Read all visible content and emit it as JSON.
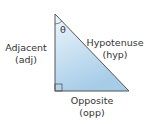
{
  "diagram": {
    "angle_label": "θ",
    "sides": {
      "adjacent": {
        "name": "Adjacent",
        "abbr": "(adj)"
      },
      "hypotenuse": {
        "name": "Hypotenuse",
        "abbr": "(hyp)"
      },
      "opposite": {
        "name": "Opposite",
        "abbr": "(opp)"
      }
    },
    "colors": {
      "fill_top": "#e8f3fb",
      "fill_bottom": "#a9cfea",
      "stroke": "#555555",
      "text": "#333333"
    }
  }
}
